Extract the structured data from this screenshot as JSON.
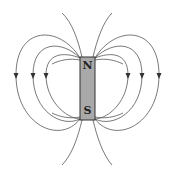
{
  "diagram": {
    "magnet": {
      "north_label": "N",
      "south_label": "S",
      "fill": "#a9a9a9",
      "stroke": "#333333"
    },
    "field_lines": {
      "color": "#555555",
      "closed_loops_per_side": 3,
      "open_lines_per_side": 1,
      "arrow_direction": "down"
    }
  }
}
